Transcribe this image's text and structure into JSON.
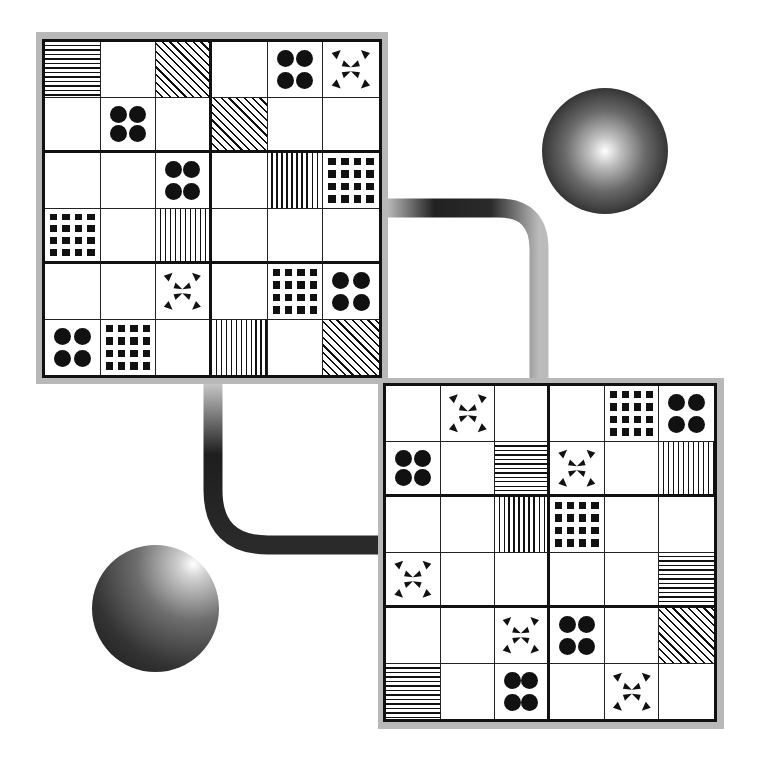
{
  "scene": {
    "description": "Two 6x6 pattern puzzle boards connected by gradient pipes with two shaded spheres",
    "colors": {
      "ink": "#111111",
      "shadow": "#b8b8b8",
      "background": "#ffffff"
    }
  },
  "pattern_legend": {
    "E": "empty",
    "H": "horizontal-lines",
    "V": "vertical-lines",
    "D": "diagonal-lines",
    "C": "four-dots",
    "S": "square-grid-16",
    "B": "arrow-burst"
  },
  "boards": [
    {
      "id": "board-top-left",
      "rows": [
        [
          "H",
          "E",
          "D",
          "E",
          "C",
          "B"
        ],
        [
          "E",
          "C",
          "E",
          "D",
          "E",
          "E"
        ],
        [
          "E",
          "E",
          "C",
          "E",
          "V",
          "S"
        ],
        [
          "S",
          "E",
          "V",
          "E",
          "E",
          "E"
        ],
        [
          "E",
          "E",
          "B",
          "E",
          "S",
          "C"
        ],
        [
          "C",
          "S",
          "E",
          "V",
          "E",
          "D"
        ]
      ]
    },
    {
      "id": "board-bottom-right",
      "rows": [
        [
          "E",
          "B",
          "E",
          "E",
          "S",
          "C"
        ],
        [
          "C",
          "E",
          "H",
          "B",
          "E",
          "V"
        ],
        [
          "E",
          "E",
          "V",
          "S",
          "E",
          "E"
        ],
        [
          "B",
          "E",
          "E",
          "E",
          "E",
          "H"
        ],
        [
          "E",
          "E",
          "B",
          "C",
          "E",
          "D"
        ],
        [
          "H",
          "E",
          "C",
          "E",
          "B",
          "E"
        ]
      ]
    }
  ],
  "spheres": [
    {
      "id": "sphere-top-right",
      "highlight": "center"
    },
    {
      "id": "sphere-bottom-left",
      "highlight": "upper-right"
    }
  ]
}
